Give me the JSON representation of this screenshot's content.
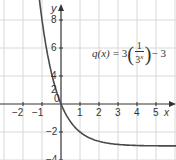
{
  "chart_data": {
    "type": "line",
    "title": "",
    "function_label": "q(x) = 3(1/3^x) − 3",
    "function": {
      "name": "q",
      "var": "x",
      "coef": "3",
      "num": "1",
      "base": "3",
      "exp": "x",
      "const": "3"
    },
    "xlabel": "x",
    "ylabel": "y",
    "xlim": [
      -3,
      6
    ],
    "ylim": [
      -5,
      10
    ],
    "x_ticks": [
      "-2",
      "-1",
      "0",
      "1",
      "2",
      "3",
      "4",
      "5"
    ],
    "y_ticks": [
      "8",
      "6",
      "4",
      "2",
      "-2",
      "-4"
    ],
    "grid": true,
    "asymptote_y": -3,
    "series": [
      {
        "name": "q(x)",
        "x": [
          -1.1,
          -1,
          -0.5,
          0,
          0.5,
          1,
          1.5,
          2,
          3,
          4,
          5,
          6
        ],
        "y": [
          8.0,
          6,
          2.2,
          0,
          -1.27,
          -2,
          -2.42,
          -2.67,
          -2.89,
          -2.96,
          -2.99,
          -3.0
        ]
      }
    ],
    "color": "#4a4a4a"
  },
  "labels": {
    "x_axis": "x",
    "y_axis": "y",
    "origin": "0",
    "xt_m2": "−2",
    "xt_m1": "−1",
    "xt_1": "1",
    "xt_2": "2",
    "xt_3": "3",
    "xt_4": "4",
    "xt_5": "5",
    "yt_8": "8",
    "yt_6": "6",
    "yt_4": "4",
    "yt_2": "2",
    "yt_m2": "−2",
    "yt_m4": "−4"
  },
  "func": {
    "lhs": "q(x)",
    "eq": "= 3",
    "num": "1",
    "den": "3",
    "exp": "x",
    "tail": "− 3"
  }
}
